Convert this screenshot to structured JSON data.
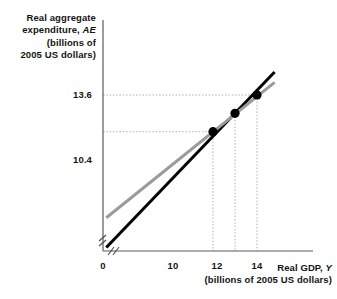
{
  "chart_data": {
    "type": "line",
    "title": "",
    "xlabel": "Real GDP, Y",
    "xlabel_main": "Real GDP,",
    "xlabel_var": "Y",
    "xlabel_units": "(billions of 2005 US dollars)",
    "ylabel_line1": "Real aggregate",
    "ylabel_line2_main": "expenditure,",
    "ylabel_line2_var": "AE",
    "ylabel_line3": "(billions of",
    "ylabel_line4": "2005 US dollars)",
    "xlim": [
      0,
      16
    ],
    "ylim": [
      0,
      16
    ],
    "grid": true,
    "grid_style": "dotted",
    "legend_position": "none",
    "axis_break": true,
    "x_ticks": [
      {
        "label": "0",
        "value": 0
      },
      {
        "label": "10",
        "value": 10
      },
      {
        "label": "12",
        "value": 12
      },
      {
        "label": "14",
        "value": 14
      }
    ],
    "y_ticks": [
      {
        "label": "13.6",
        "value": 13.6
      },
      {
        "label": "10.4",
        "value": 10.4
      }
    ],
    "series": [
      {
        "name": "45-degree line",
        "color": "#000000",
        "width": 3,
        "points": [
          [
            0.3,
            0.3
          ],
          [
            15.6,
            15.6
          ]
        ]
      },
      {
        "name": "AE aggregate expenditure line",
        "color": "#9a9a9a",
        "width": 3,
        "points": [
          [
            0.3,
            2.9
          ],
          [
            15.6,
            14.7
          ]
        ]
      }
    ],
    "points": [
      {
        "label": "",
        "x": 10,
        "y": 10.4,
        "color": "#000000"
      },
      {
        "label": "",
        "x": 12,
        "y": 12.0,
        "color": "#000000"
      },
      {
        "label": "",
        "x": 14,
        "y": 13.6,
        "color": "#000000"
      }
    ],
    "guide_lines": [
      {
        "x": 10,
        "y": 10.4
      },
      {
        "x": 14,
        "y": 13.6
      }
    ]
  }
}
